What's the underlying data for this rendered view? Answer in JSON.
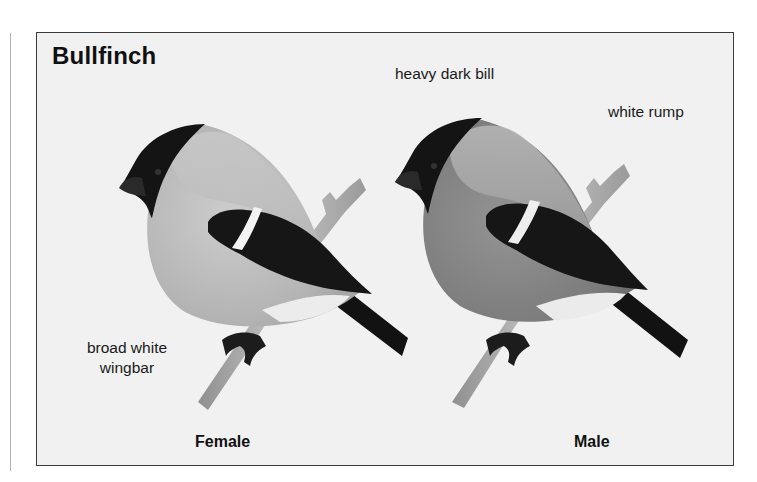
{
  "plate": {
    "title": "Bullfinch",
    "annotations": {
      "bill": "heavy dark bill",
      "rump": "white rump",
      "wingbar_line1": "broad white",
      "wingbar_line2": "wingbar"
    },
    "birds": [
      {
        "label": "Female",
        "body_color": "#b9b9b9"
      },
      {
        "label": "Male",
        "body_color": "#8a8a8a"
      }
    ],
    "colors": {
      "background": "#f1f1f1",
      "border": "#3a3a3a",
      "cap": "#141414",
      "wing": "#161616",
      "wingbar": "#f4f4f4",
      "branch": "#a8a8a8"
    }
  }
}
